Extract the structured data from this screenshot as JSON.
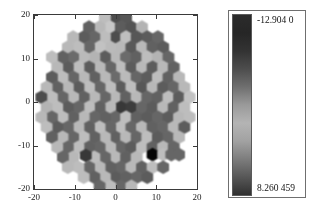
{
  "figure": {
    "type": "hexbin-som-umatrix",
    "background": "#ffffff"
  },
  "plot": {
    "name": "hexagonal-som-map",
    "shape": "disk",
    "xaxis": {
      "label": "",
      "min": -20,
      "max": 20,
      "ticks": [
        -20,
        -10,
        0,
        10,
        20
      ],
      "ticklabels": [
        "-20",
        "-10",
        "0",
        "10",
        "20"
      ]
    },
    "yaxis": {
      "label": "",
      "min": -20,
      "max": 20,
      "ticks": [
        -20,
        -10,
        0,
        10,
        20
      ],
      "ticklabels": [
        "-20",
        "-10",
        "0",
        "10",
        "20"
      ]
    },
    "highlight": {
      "name": "black-hexagon",
      "x": 9,
      "y": -12,
      "color": "#111111"
    }
  },
  "colorbar": {
    "name": "grayscale-colorbar",
    "orientation": "vertical",
    "top_label": "-12.904 0",
    "bottom_label": "8.260 459",
    "top_value": -12.904,
    "bottom_value": 8.260459,
    "stops": [
      {
        "pos": 0,
        "color": "#2b2b2b"
      },
      {
        "pos": 10,
        "color": "#262626"
      },
      {
        "pos": 20,
        "color": "#333333"
      },
      {
        "pos": 30,
        "color": "#4d4d4d"
      },
      {
        "pos": 40,
        "color": "#6f6f6f"
      },
      {
        "pos": 50,
        "color": "#9a9a9a"
      },
      {
        "pos": 60,
        "color": "#b4b4b4"
      },
      {
        "pos": 70,
        "color": "#a2a2a2"
      },
      {
        "pos": 80,
        "color": "#7d7d7d"
      },
      {
        "pos": 90,
        "color": "#575757"
      },
      {
        "pos": 100,
        "color": "#303030"
      }
    ]
  },
  "chart_data": {
    "type": "heatmap",
    "title": "",
    "xlabel": "",
    "ylabel": "",
    "xlim": [
      -20,
      20
    ],
    "ylim": [
      -20,
      20
    ],
    "xticks": [
      -20,
      -10,
      0,
      10,
      20
    ],
    "yticks": [
      -20,
      -10,
      0,
      10,
      20
    ],
    "grid": false,
    "legend": "colorbar-right",
    "colormap": "gray",
    "vmin": -12.904,
    "vmax": 8.260459,
    "marker": "hexagon",
    "hex_radius": 1.55,
    "hex_spacing": 2.6,
    "domain_radius": 20.0,
    "cells": [
      {
        "x": 0,
        "y": 19.5,
        "v": 0.3
      },
      {
        "x": 2.6,
        "y": 19.5,
        "v": 0.34
      },
      {
        "x": -2.6,
        "y": 19.5,
        "v": 0.74
      },
      {
        "x": -1.3,
        "y": 17.2,
        "v": 0.78
      },
      {
        "x": 1.3,
        "y": 17.2,
        "v": 0.36
      },
      {
        "x": 3.9,
        "y": 17.2,
        "v": 0.33
      },
      {
        "x": 6.5,
        "y": 17.2,
        "v": 0.7
      },
      {
        "x": -3.9,
        "y": 17.2,
        "v": 0.72
      },
      {
        "x": -6.5,
        "y": 17.2,
        "v": 0.38
      },
      {
        "x": 0,
        "y": 14.9,
        "v": 0.3
      },
      {
        "x": 2.6,
        "y": 14.9,
        "v": 0.75
      },
      {
        "x": 5.2,
        "y": 14.9,
        "v": 0.34
      },
      {
        "x": 7.8,
        "y": 14.9,
        "v": 0.36
      },
      {
        "x": -2.6,
        "y": 14.9,
        "v": 0.74
      },
      {
        "x": -5.2,
        "y": 14.9,
        "v": 0.4
      },
      {
        "x": -7.8,
        "y": 14.9,
        "v": 0.36
      },
      {
        "x": -10.4,
        "y": 14.9,
        "v": 0.72
      },
      {
        "x": 10.4,
        "y": 14.9,
        "v": 0.4
      },
      {
        "x": 1.3,
        "y": 12.6,
        "v": 0.72
      },
      {
        "x": 3.9,
        "y": 12.6,
        "v": 0.35
      },
      {
        "x": 6.5,
        "y": 12.6,
        "v": 0.72
      },
      {
        "x": 9.1,
        "y": 12.6,
        "v": 0.38
      },
      {
        "x": 11.7,
        "y": 12.6,
        "v": 0.36
      },
      {
        "x": -1.3,
        "y": 12.6,
        "v": 0.73
      },
      {
        "x": -3.9,
        "y": 12.6,
        "v": 0.76
      },
      {
        "x": -6.5,
        "y": 12.6,
        "v": 0.4
      },
      {
        "x": -9.1,
        "y": 12.6,
        "v": 0.74
      },
      {
        "x": -11.7,
        "y": 12.6,
        "v": 0.72
      },
      {
        "x": 0,
        "y": 10.3,
        "v": 0.72
      },
      {
        "x": 2.6,
        "y": 10.3,
        "v": 0.42
      },
      {
        "x": 5.2,
        "y": 10.3,
        "v": 0.38
      },
      {
        "x": 7.8,
        "y": 10.3,
        "v": 0.74
      },
      {
        "x": 10.4,
        "y": 10.3,
        "v": 0.7
      },
      {
        "x": 13.0,
        "y": 10.3,
        "v": 0.4
      },
      {
        "x": -2.6,
        "y": 10.3,
        "v": 0.36
      },
      {
        "x": -5.2,
        "y": 10.3,
        "v": 0.7
      },
      {
        "x": -7.8,
        "y": 10.3,
        "v": 0.73
      },
      {
        "x": -10.4,
        "y": 10.3,
        "v": 0.42
      },
      {
        "x": -13.0,
        "y": 10.3,
        "v": 0.38
      },
      {
        "x": -15.6,
        "y": 10.3,
        "v": 0.74
      },
      {
        "x": 1.3,
        "y": 8.0,
        "v": 0.74
      },
      {
        "x": 3.9,
        "y": 8.0,
        "v": 0.36
      },
      {
        "x": 6.5,
        "y": 8.0,
        "v": 0.72
      },
      {
        "x": 9.1,
        "y": 8.0,
        "v": 0.36
      },
      {
        "x": 11.7,
        "y": 8.0,
        "v": 0.72
      },
      {
        "x": 14.3,
        "y": 8.0,
        "v": 0.38
      },
      {
        "x": -1.3,
        "y": 8.0,
        "v": 0.4
      },
      {
        "x": -3.9,
        "y": 8.0,
        "v": 0.72
      },
      {
        "x": -6.5,
        "y": 8.0,
        "v": 0.36
      },
      {
        "x": -9.1,
        "y": 8.0,
        "v": 0.74
      },
      {
        "x": -11.7,
        "y": 8.0,
        "v": 0.36
      },
      {
        "x": -14.3,
        "y": 8.0,
        "v": 0.72
      },
      {
        "x": 0,
        "y": 5.7,
        "v": 0.42
      },
      {
        "x": 2.6,
        "y": 5.7,
        "v": 0.73
      },
      {
        "x": 5.2,
        "y": 5.7,
        "v": 0.4
      },
      {
        "x": 7.8,
        "y": 5.7,
        "v": 0.36
      },
      {
        "x": 10.4,
        "y": 5.7,
        "v": 0.74
      },
      {
        "x": 13.0,
        "y": 5.7,
        "v": 0.38
      },
      {
        "x": 15.6,
        "y": 5.7,
        "v": 0.72
      },
      {
        "x": -2.6,
        "y": 5.7,
        "v": 0.72
      },
      {
        "x": -5.2,
        "y": 5.7,
        "v": 0.38
      },
      {
        "x": -7.8,
        "y": 5.7,
        "v": 0.72
      },
      {
        "x": -10.4,
        "y": 5.7,
        "v": 0.4
      },
      {
        "x": -13.0,
        "y": 5.7,
        "v": 0.74
      },
      {
        "x": -15.6,
        "y": 5.7,
        "v": 0.36
      },
      {
        "x": 1.3,
        "y": 3.4,
        "v": 0.36
      },
      {
        "x": 3.9,
        "y": 3.4,
        "v": 0.74
      },
      {
        "x": 6.5,
        "y": 3.4,
        "v": 0.34
      },
      {
        "x": 9.1,
        "y": 3.4,
        "v": 0.72
      },
      {
        "x": 11.7,
        "y": 3.4,
        "v": 0.36
      },
      {
        "x": 14.3,
        "y": 3.4,
        "v": 0.4
      },
      {
        "x": 16.9,
        "y": 3.4,
        "v": 0.72
      },
      {
        "x": -1.3,
        "y": 3.4,
        "v": 0.74
      },
      {
        "x": -3.9,
        "y": 3.4,
        "v": 0.4
      },
      {
        "x": -6.5,
        "y": 3.4,
        "v": 0.74
      },
      {
        "x": -9.1,
        "y": 3.4,
        "v": 0.36
      },
      {
        "x": -11.7,
        "y": 3.4,
        "v": 0.72
      },
      {
        "x": -14.3,
        "y": 3.4,
        "v": 0.38
      },
      {
        "x": -16.9,
        "y": 3.4,
        "v": 0.72
      },
      {
        "x": 0,
        "y": 1.1,
        "v": 0.72
      },
      {
        "x": 2.6,
        "y": 1.1,
        "v": 0.38
      },
      {
        "x": 5.2,
        "y": 1.1,
        "v": 0.72
      },
      {
        "x": 7.8,
        "y": 1.1,
        "v": 0.4
      },
      {
        "x": 10.4,
        "y": 1.1,
        "v": 0.38
      },
      {
        "x": 13.0,
        "y": 1.1,
        "v": 0.74
      },
      {
        "x": 15.6,
        "y": 1.1,
        "v": 0.36
      },
      {
        "x": 18.2,
        "y": 1.1,
        "v": 0.76
      },
      {
        "x": -2.6,
        "y": 1.1,
        "v": 0.4
      },
      {
        "x": -5.2,
        "y": 1.1,
        "v": 0.72
      },
      {
        "x": -7.8,
        "y": 1.1,
        "v": 0.38
      },
      {
        "x": -10.4,
        "y": 1.1,
        "v": 0.72
      },
      {
        "x": -13.0,
        "y": 1.1,
        "v": 0.4
      },
      {
        "x": -15.6,
        "y": 1.1,
        "v": 0.74
      },
      {
        "x": -18.2,
        "y": 1.1,
        "v": 0.3
      },
      {
        "x": 1.3,
        "y": -1.2,
        "v": 0.22
      },
      {
        "x": 3.9,
        "y": -1.2,
        "v": 0.24
      },
      {
        "x": 6.5,
        "y": -1.2,
        "v": 0.4
      },
      {
        "x": 9.1,
        "y": -1.2,
        "v": 0.36
      },
      {
        "x": 11.7,
        "y": -1.2,
        "v": 0.72
      },
      {
        "x": 14.3,
        "y": -1.2,
        "v": 0.38
      },
      {
        "x": 16.9,
        "y": -1.2,
        "v": 0.74
      },
      {
        "x": -1.3,
        "y": -1.2,
        "v": 0.72
      },
      {
        "x": -3.9,
        "y": -1.2,
        "v": 0.38
      },
      {
        "x": -6.5,
        "y": -1.2,
        "v": 0.74
      },
      {
        "x": -9.1,
        "y": -1.2,
        "v": 0.4
      },
      {
        "x": -11.7,
        "y": -1.2,
        "v": 0.36
      },
      {
        "x": -14.3,
        "y": -1.2,
        "v": 0.74
      },
      {
        "x": -16.9,
        "y": -1.2,
        "v": 0.7
      },
      {
        "x": 0,
        "y": -3.5,
        "v": 0.4
      },
      {
        "x": 2.6,
        "y": -3.5,
        "v": 0.74
      },
      {
        "x": 5.2,
        "y": -3.5,
        "v": 0.38
      },
      {
        "x": 7.8,
        "y": -3.5,
        "v": 0.36
      },
      {
        "x": 10.4,
        "y": -3.5,
        "v": 0.4
      },
      {
        "x": 13.0,
        "y": -3.5,
        "v": 0.36
      },
      {
        "x": 15.6,
        "y": -3.5,
        "v": 0.72
      },
      {
        "x": 18.2,
        "y": -3.5,
        "v": 0.74
      },
      {
        "x": -2.6,
        "y": -3.5,
        "v": 0.38
      },
      {
        "x": -5.2,
        "y": -3.5,
        "v": 0.4
      },
      {
        "x": -7.8,
        "y": -3.5,
        "v": 0.72
      },
      {
        "x": -10.4,
        "y": -3.5,
        "v": 0.38
      },
      {
        "x": -13.0,
        "y": -3.5,
        "v": 0.74
      },
      {
        "x": -15.6,
        "y": -3.5,
        "v": 0.4
      },
      {
        "x": -18.2,
        "y": -3.5,
        "v": 0.72
      },
      {
        "x": 1.3,
        "y": -5.8,
        "v": 0.74
      },
      {
        "x": 3.9,
        "y": -5.8,
        "v": 0.4
      },
      {
        "x": 6.5,
        "y": -5.8,
        "v": 0.72
      },
      {
        "x": 9.1,
        "y": -5.8,
        "v": 0.38
      },
      {
        "x": 11.7,
        "y": -5.8,
        "v": 0.4
      },
      {
        "x": 14.3,
        "y": -5.8,
        "v": 0.72
      },
      {
        "x": 16.9,
        "y": -5.8,
        "v": 0.36
      },
      {
        "x": -1.3,
        "y": -5.8,
        "v": 0.4
      },
      {
        "x": -3.9,
        "y": -5.8,
        "v": 0.74
      },
      {
        "x": -6.5,
        "y": -5.8,
        "v": 0.38
      },
      {
        "x": -9.1,
        "y": -5.8,
        "v": 0.72
      },
      {
        "x": -11.7,
        "y": -5.8,
        "v": 0.4
      },
      {
        "x": -14.3,
        "y": -5.8,
        "v": 0.36
      },
      {
        "x": -16.9,
        "y": -5.8,
        "v": 0.74
      },
      {
        "x": 0,
        "y": -8.1,
        "v": 0.38
      },
      {
        "x": 2.6,
        "y": -8.1,
        "v": 0.72
      },
      {
        "x": 5.2,
        "y": -8.1,
        "v": 0.4
      },
      {
        "x": 7.8,
        "y": -8.1,
        "v": 0.74
      },
      {
        "x": 10.4,
        "y": -8.1,
        "v": 0.36
      },
      {
        "x": 13.0,
        "y": -8.1,
        "v": 0.4
      },
      {
        "x": 15.6,
        "y": -8.1,
        "v": 0.72
      },
      {
        "x": -2.6,
        "y": -8.1,
        "v": 0.72
      },
      {
        "x": -5.2,
        "y": -8.1,
        "v": 0.38
      },
      {
        "x": -7.8,
        "y": -8.1,
        "v": 0.74
      },
      {
        "x": -10.4,
        "y": -8.1,
        "v": 0.4
      },
      {
        "x": -13.0,
        "y": -8.1,
        "v": 0.72
      },
      {
        "x": -15.6,
        "y": -8.1,
        "v": 0.38
      },
      {
        "x": 1.3,
        "y": -10.4,
        "v": 0.4
      },
      {
        "x": 3.9,
        "y": -10.4,
        "v": 0.36
      },
      {
        "x": 6.5,
        "y": -10.4,
        "v": 0.74
      },
      {
        "x": 9.1,
        "y": -10.4,
        "v": 0.38
      },
      {
        "x": 11.7,
        "y": -10.4,
        "v": 0.72
      },
      {
        "x": 14.3,
        "y": -10.4,
        "v": 0.4
      },
      {
        "x": -1.3,
        "y": -10.4,
        "v": 0.72
      },
      {
        "x": -3.9,
        "y": -10.4,
        "v": 0.4
      },
      {
        "x": -6.5,
        "y": -10.4,
        "v": 0.38
      },
      {
        "x": -9.1,
        "y": -10.4,
        "v": 0.74
      },
      {
        "x": -11.7,
        "y": -10.4,
        "v": 0.4
      },
      {
        "x": -14.3,
        "y": -10.4,
        "v": 0.72
      },
      {
        "x": 0,
        "y": -12.7,
        "v": 0.72
      },
      {
        "x": 2.6,
        "y": -12.7,
        "v": 0.38
      },
      {
        "x": 5.2,
        "y": -12.7,
        "v": 0.72
      },
      {
        "x": 9.1,
        "y": -12.1,
        "v": 0.02
      },
      {
        "x": 11.7,
        "y": -12.1,
        "v": 0.74
      },
      {
        "x": 13.7,
        "y": -12.1,
        "v": 0.4
      },
      {
        "x": 15.6,
        "y": -12.1,
        "v": 0.4
      },
      {
        "x": -2.6,
        "y": -12.7,
        "v": 0.4
      },
      {
        "x": -5.2,
        "y": -12.7,
        "v": 0.74
      },
      {
        "x": -7.3,
        "y": -12.3,
        "v": 0.22
      },
      {
        "x": -10.4,
        "y": -12.7,
        "v": 0.72
      },
      {
        "x": -12.9,
        "y": -12.7,
        "v": 0.4
      },
      {
        "x": 1.3,
        "y": -15.0,
        "v": 0.4
      },
      {
        "x": 3.9,
        "y": -15.0,
        "v": 0.72
      },
      {
        "x": 6.5,
        "y": -15.0,
        "v": 0.38
      },
      {
        "x": 9.1,
        "y": -15.0,
        "v": 0.74
      },
      {
        "x": 11.7,
        "y": -15.0,
        "v": 0.4
      },
      {
        "x": -1.3,
        "y": -15.0,
        "v": 0.38
      },
      {
        "x": -3.9,
        "y": -15.0,
        "v": 0.72
      },
      {
        "x": -6.5,
        "y": -15.0,
        "v": 0.4
      },
      {
        "x": -9.1,
        "y": -15.0,
        "v": 0.74
      },
      {
        "x": -11.7,
        "y": -15.0,
        "v": 0.72
      },
      {
        "x": 0,
        "y": -17.3,
        "v": 0.36
      },
      {
        "x": 2.6,
        "y": -17.3,
        "v": 0.38
      },
      {
        "x": 5.2,
        "y": -17.3,
        "v": 0.4
      },
      {
        "x": 7.8,
        "y": -17.3,
        "v": 0.36
      },
      {
        "x": -2.6,
        "y": -17.3,
        "v": 0.72
      },
      {
        "x": -5.2,
        "y": -17.3,
        "v": 0.38
      },
      {
        "x": -7.8,
        "y": -17.3,
        "v": 0.74
      },
      {
        "x": 1.3,
        "y": -19.4,
        "v": 0.4
      },
      {
        "x": 3.9,
        "y": -19.4,
        "v": 0.72
      },
      {
        "x": -1.3,
        "y": -19.4,
        "v": 0.74
      },
      {
        "x": -3.9,
        "y": -19.4,
        "v": 0.4
      }
    ]
  }
}
